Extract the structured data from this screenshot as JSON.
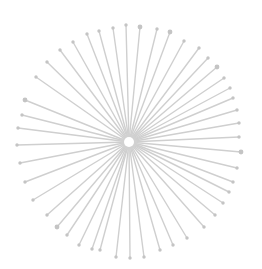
{
  "diagram": {
    "type": "radial-network",
    "width": 262,
    "height": 269,
    "colors": {
      "background": "#ffffff",
      "edge": "#cfcfcf",
      "node": "#c4c4c4",
      "hub_fill": "#ffffff",
      "hub_ring": "#d2d2d2"
    },
    "hub": {
      "x": 129,
      "y": 142,
      "r": 5
    },
    "leaves": [
      [
        126,
        25
      ],
      [
        140,
        27
      ],
      [
        157,
        29
      ],
      [
        170,
        32
      ],
      [
        184,
        41
      ],
      [
        199,
        48
      ],
      [
        208,
        58
      ],
      [
        217,
        67
      ],
      [
        224,
        78
      ],
      [
        230,
        88
      ],
      [
        233,
        98
      ],
      [
        237,
        110
      ],
      [
        239,
        123
      ],
      [
        239,
        137
      ],
      [
        241,
        152
      ],
      [
        237,
        168
      ],
      [
        233,
        182
      ],
      [
        229,
        192
      ],
      [
        223,
        203
      ],
      [
        215,
        215
      ],
      [
        204,
        227
      ],
      [
        187,
        238
      ],
      [
        173,
        245
      ],
      [
        160,
        250
      ],
      [
        144,
        257
      ],
      [
        130,
        258
      ],
      [
        116,
        257
      ],
      [
        100,
        250
      ],
      [
        92,
        249
      ],
      [
        79,
        245
      ],
      [
        67,
        235
      ],
      [
        57,
        227
      ],
      [
        47,
        215
      ],
      [
        33,
        200
      ],
      [
        25,
        182
      ],
      [
        20,
        163
      ],
      [
        17,
        145
      ],
      [
        18,
        128
      ],
      [
        22,
        115
      ],
      [
        25,
        100
      ],
      [
        36,
        77
      ],
      [
        47,
        62
      ],
      [
        60,
        50
      ],
      [
        73,
        42
      ],
      [
        87,
        34
      ],
      [
        99,
        31
      ],
      [
        113,
        28
      ]
    ],
    "large_leaves": [
      1,
      3,
      7,
      14,
      31,
      39
    ]
  }
}
